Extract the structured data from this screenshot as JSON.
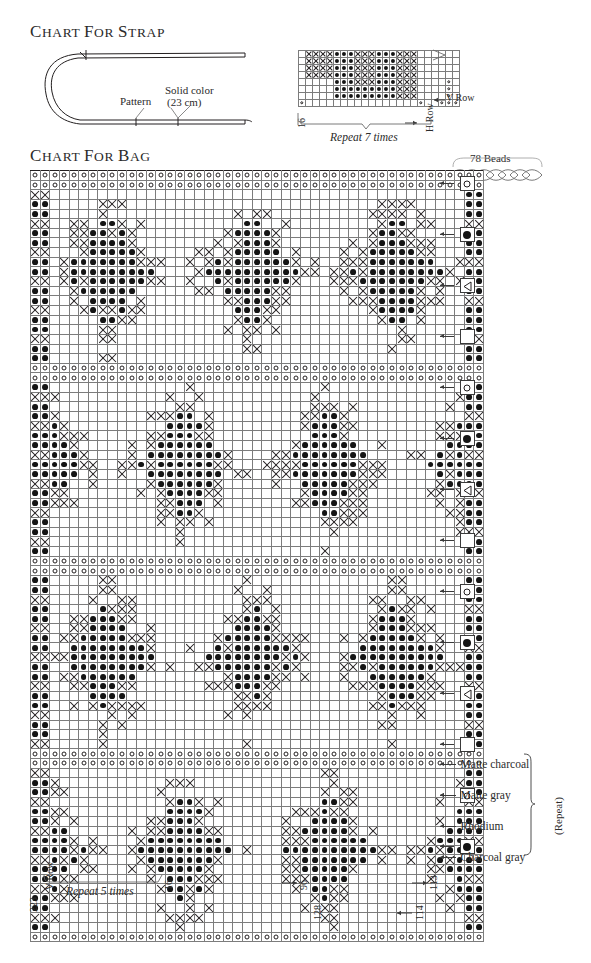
{
  "page": {
    "width": 591,
    "height": 963,
    "background": "#ffffff",
    "ink": "#231f20"
  },
  "strap_section": {
    "title": "Chart for Strap",
    "diagram": {
      "label_pattern": "Pattern",
      "label_solid_color": "Solid color",
      "label_solid_color_measure": "(23 cm)"
    },
    "chart": {
      "repeat_label": "Repeat 7 times",
      "v_row_label": "V Row",
      "h_row_label": "H Row",
      "count_left": "16",
      "columns": 23,
      "rows": 8
    }
  },
  "bag_section": {
    "title": "Chart for Bag",
    "beads": {
      "count_label": "78 Beads"
    },
    "chart": {
      "columns": 47,
      "rows": 80
    },
    "legend": {
      "repeat_bracket_label": "(Repeat)",
      "colors": [
        {
          "name": "Matte charcoal",
          "symbol": "filled-dot"
        },
        {
          "name": "Matte gray",
          "symbol": "triangle"
        },
        {
          "name": "Rhodium",
          "symbol": "blank-square"
        },
        {
          "name": "Charcoal gray",
          "symbol": "open-circle"
        }
      ],
      "key_cycle": [
        "open-circle",
        "filled-dot",
        "triangle",
        "blank-square"
      ]
    },
    "axis_labels": {
      "bottom_left_count": "223",
      "bottom_left_v_row": "V Row",
      "repeat_label": "Repeat 5 times",
      "count_16": "16",
      "count_96": "96",
      "count_128": "128",
      "count_113": "113",
      "count_114": "114"
    }
  },
  "chart_data": {
    "type": "heatmap",
    "title": "Chart for Bag",
    "symbols": {
      "open-circle": "Charcoal gray",
      "filled-dot": "Matte charcoal",
      "x-cross": "Matte gray",
      "blank": "Rhodium"
    },
    "grid": {
      "columns": 47,
      "rows": 80,
      "cell_px": 8.65
    },
    "strap_grid": {
      "columns": 23,
      "rows": 8,
      "repeat": "Repeat 7 times"
    },
    "xlabel": "",
    "ylabel": "",
    "legend_position": "right"
  }
}
